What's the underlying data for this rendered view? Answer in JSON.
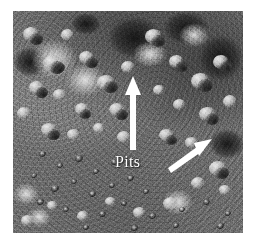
{
  "figure": {
    "kind": "grayscale-surface-photograph",
    "background_color": "#ffffff",
    "photo": {
      "x": 13,
      "y": 11,
      "width": 230,
      "height": 222,
      "base_color": "#6e6e6e",
      "highlight_color": "#e8e8e8",
      "shadow_color": "#1e1e1e"
    }
  },
  "annotations": {
    "label": {
      "text": "Pits",
      "color": "#ffffff",
      "x": 102,
      "y": 143,
      "font_size_px": 16
    },
    "arrows": [
      {
        "name": "vertical-arrow",
        "color": "#ffffff",
        "direction": "up",
        "tail_x": 133,
        "tail_y": 150,
        "head_x": 133,
        "head_y": 76
      },
      {
        "name": "diagonal-arrow",
        "color": "#ffffff",
        "direction": "up-right",
        "tail_x": 168,
        "tail_y": 165,
        "head_x": 212,
        "head_y": 139
      }
    ]
  }
}
